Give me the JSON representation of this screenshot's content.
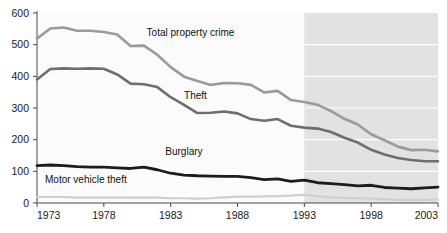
{
  "chart_data": {
    "type": "line",
    "title": "",
    "subtitle": "",
    "xlabel": "",
    "ylabel": "",
    "xlim": [
      1973,
      2003
    ],
    "ylim": [
      0,
      600
    ],
    "grid": false,
    "legend_position": "inline-annotations",
    "y_ticks": [
      0,
      100,
      200,
      300,
      400,
      500,
      600
    ],
    "y_tick_labels": [
      "0",
      "100",
      "200",
      "300",
      "400",
      "500",
      "600"
    ],
    "x_ticks": [
      1973,
      1978,
      1983,
      1988,
      1993,
      1998,
      2003
    ],
    "x_tick_labels": [
      "1973",
      "1978",
      "1983",
      "1988",
      "1993",
      "1998",
      "2003"
    ],
    "x": [
      1973,
      1974,
      1975,
      1976,
      1977,
      1978,
      1979,
      1980,
      1981,
      1982,
      1983,
      1984,
      1985,
      1986,
      1987,
      1988,
      1989,
      1990,
      1991,
      1992,
      1993,
      1994,
      1995,
      1996,
      1997,
      1998,
      1999,
      2000,
      2001,
      2002,
      2003
    ],
    "series": [
      {
        "name": "Total property crime",
        "color": "#9a9a9a",
        "width": 2.6,
        "values": [
          519,
          551,
          554,
          544,
          544,
          540,
          532,
          496,
          497,
          468,
          429,
          399,
          385,
          373,
          379,
          378,
          373,
          349,
          354,
          325,
          319,
          310,
          290,
          266,
          248,
          217,
          198,
          178,
          167,
          168,
          163
        ]
      },
      {
        "name": "Theft",
        "color": "#6e6e6e",
        "width": 2.6,
        "values": [
          390,
          423,
          425,
          424,
          425,
          424,
          406,
          377,
          375,
          366,
          334,
          310,
          284,
          285,
          289,
          283,
          265,
          260,
          265,
          244,
          238,
          235,
          224,
          206,
          191,
          168,
          153,
          142,
          136,
          132,
          132
        ]
      },
      {
        "name": "Burglary",
        "color": "#1c1c1c",
        "width": 2.8,
        "values": [
          118,
          120,
          118,
          115,
          113,
          113,
          111,
          109,
          113,
          105,
          94,
          88,
          86,
          85,
          84,
          84,
          80,
          74,
          76,
          68,
          72,
          64,
          61,
          58,
          54,
          56,
          49,
          47,
          45,
          48,
          50
        ]
      },
      {
        "name": "Motor vehicle theft",
        "color": "#cfcfcf",
        "width": 2.2,
        "values": [
          19,
          19,
          19,
          17,
          17,
          17,
          17,
          17,
          18,
          17,
          15,
          15,
          14,
          15,
          18,
          20,
          20,
          21,
          22,
          23,
          26,
          21,
          18,
          16,
          15,
          14,
          12,
          10,
          10,
          10,
          11
        ]
      }
    ],
    "annotations": [
      {
        "text": "Total property crime",
        "x": 1981.2,
        "y": 527,
        "anchor": "start"
      },
      {
        "text": "Theft",
        "x": 1984.0,
        "y": 330,
        "anchor": "start"
      },
      {
        "text": "Burglary",
        "x": 1982.6,
        "y": 152,
        "anchor": "start"
      },
      {
        "text": "Motor vehicle theft",
        "x": 1973.6,
        "y": 62,
        "anchor": "start"
      }
    ],
    "shaded_region": {
      "x_start": 1993,
      "x_end": 2003,
      "color": "#e2e2e2",
      "gridline_color": "#ffffff",
      "gridline_values": [
        100,
        200,
        300,
        400,
        500
      ]
    },
    "axis_color": "#4a4a4a",
    "plot_background": "#fbfbfb"
  }
}
